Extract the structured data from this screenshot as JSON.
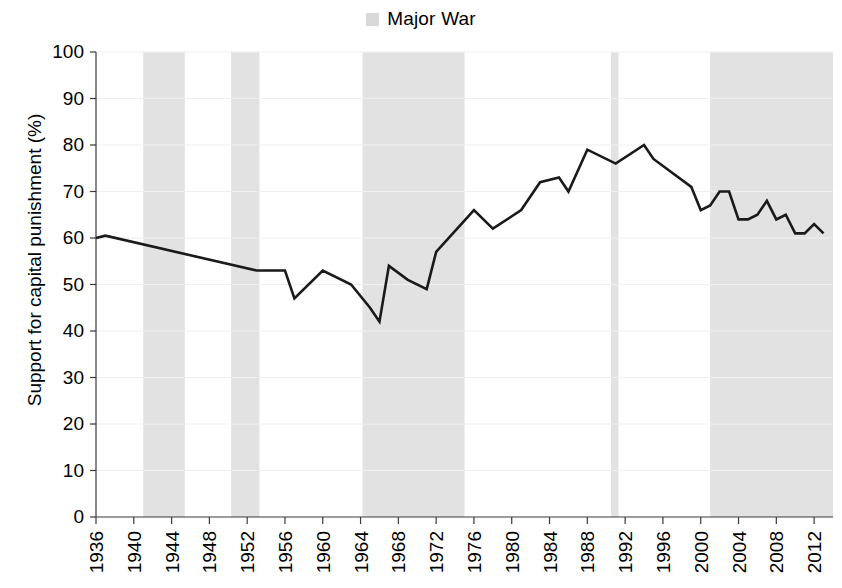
{
  "legend": {
    "entries": [
      {
        "label": "Major War",
        "color": "#d9d9d9",
        "marker": "square"
      }
    ],
    "position": "top-center"
  },
  "chart_data": {
    "type": "line",
    "title": "",
    "subtitle": "",
    "xlabel": "",
    "ylabel": "Support for capital punishment (%)",
    "xlim": [
      1936,
      2014
    ],
    "ylim": [
      0,
      100
    ],
    "grid": false,
    "legend_position": "top-center",
    "x_tick_labels": [
      "1936",
      "1940",
      "1944",
      "1948",
      "1952",
      "1956",
      "1960",
      "1964",
      "1968",
      "1972",
      "1976",
      "1980",
      "1984",
      "1988",
      "1992",
      "1996",
      "2000",
      "2004",
      "2008",
      "2012"
    ],
    "y_tick_labels": [
      "0",
      "10",
      "20",
      "30",
      "40",
      "50",
      "60",
      "70",
      "80",
      "90",
      "100"
    ],
    "x_tick_values": [
      1936,
      1940,
      1944,
      1948,
      1952,
      1956,
      1960,
      1964,
      1968,
      1972,
      1976,
      1980,
      1984,
      1988,
      1992,
      1996,
      2000,
      2004,
      2008,
      2012
    ],
    "y_tick_values": [
      0,
      10,
      20,
      30,
      40,
      50,
      60,
      70,
      80,
      90,
      100
    ],
    "series": [
      {
        "name": "Support for capital punishment (%)",
        "color": "#1a1a1a",
        "x": [
          1936,
          1937,
          1953,
          1956,
          1957,
          1960,
          1963,
          1965,
          1966,
          1967,
          1969,
          1971,
          1972,
          1976,
          1978,
          1981,
          1983,
          1985,
          1986,
          1988,
          1991,
          1994,
          1995,
          1999,
          2000,
          2001,
          2002,
          2003,
          2004,
          2005,
          2006,
          2007,
          2008,
          2009,
          2010,
          2011,
          2012,
          2013
        ],
        "y": [
          60,
          60.5,
          53,
          53,
          47,
          53,
          50,
          45,
          42,
          54,
          51,
          49,
          57,
          66,
          62,
          66,
          72,
          73,
          70,
          79,
          76,
          80,
          77,
          71,
          66,
          67,
          70,
          70,
          64,
          64,
          65,
          68,
          64,
          65,
          61,
          61,
          63,
          61
        ]
      }
    ],
    "shaded_regions": [
      {
        "label": "Major War",
        "start": 1941,
        "end": 1945.4,
        "color": "#e2e2e2"
      },
      {
        "label": "Major War",
        "start": 1950.3,
        "end": 1953.3,
        "color": "#e2e2e2"
      },
      {
        "label": "Major War",
        "start": 1964.2,
        "end": 1975.0,
        "color": "#e2e2e2"
      },
      {
        "label": "Major War",
        "start": 1990.5,
        "end": 1991.3,
        "color": "#e2e2e2"
      },
      {
        "label": "Major War",
        "start": 2001.0,
        "end": 2014.0,
        "color": "#e2e2e2"
      }
    ]
  }
}
